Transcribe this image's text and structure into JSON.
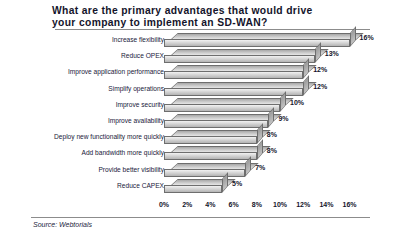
{
  "chart_data": {
    "type": "bar",
    "orientation": "horizontal",
    "style": "3d",
    "title": "What are the primary advantages that would drive\nyour company to implement an SD-WAN?",
    "categories": [
      "Increase flexibility",
      "Reduce OPEX",
      "Improve application performance",
      "Simplify operations",
      "Improve security",
      "Improve availability",
      "Deploy new functionality more quickly",
      "Add bandwidth more quickly",
      "Provide better visibility",
      "Reduce CAPEX"
    ],
    "values": [
      16,
      13,
      12,
      12,
      10,
      9,
      8,
      8,
      7,
      5
    ],
    "value_labels": [
      "16%",
      "13%",
      "12%",
      "12%",
      "10%",
      "9%",
      "8%",
      "8%",
      "7%",
      "5%"
    ],
    "xlabel": "",
    "ylabel": "",
    "xlim": [
      0,
      16
    ],
    "xtick_values": [
      0,
      2,
      4,
      6,
      8,
      10,
      12,
      14,
      16
    ],
    "xtick_labels": [
      "0%",
      "2%",
      "4%",
      "6%",
      "8%",
      "10%",
      "12%",
      "14%",
      "16%"
    ],
    "grid": false,
    "legend": false,
    "bar_color": "#dcdcdc",
    "bar_edge_color": "#6e6e6e",
    "text_color": "#14142b",
    "background": "#ffffff"
  },
  "footer": {
    "source": "Source: Webtorials"
  }
}
